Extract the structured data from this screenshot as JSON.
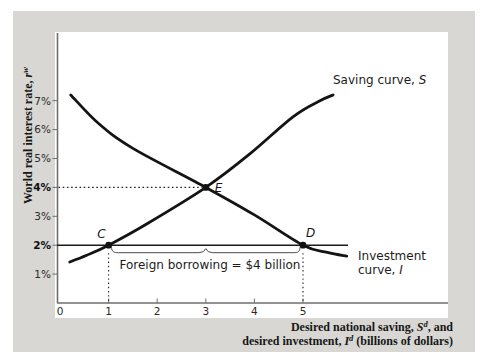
{
  "figure_labels": {
    "saving_curve": {
      "prefix": "Saving curve, ",
      "symbol": "S"
    },
    "investment_curve": {
      "line1": "Investment",
      "line2_prefix": "curve, ",
      "symbol": "I"
    },
    "annotation_foreign_borrowing": "Foreign borrowing = $4 billion",
    "y_axis_title": {
      "prefix": "World real interest rate, ",
      "symbol": "r",
      "superscript": "w"
    },
    "x_axis_title_line1": {
      "prefix": "Desired national saving, ",
      "symbol": "S",
      "superscript": "d",
      "suffix": ", and"
    },
    "x_axis_title_line2": {
      "prefix": "desired investment, ",
      "symbol": "I",
      "superscript": "d",
      "suffix": " (billions of dollars)"
    }
  },
  "chart_data": {
    "type": "line",
    "title": "",
    "xlabel": "Desired national saving, Sd, and desired investment, Id (billions of dollars)",
    "ylabel": "World real interest rate, rw (percent)",
    "xlim": [
      0,
      6.2
    ],
    "ylim_percent": [
      0,
      8
    ],
    "grid": false,
    "legend_position": "labels-on-curves",
    "x_ticks": [
      {
        "value": 0,
        "label": "0"
      },
      {
        "value": 1,
        "label": "1"
      },
      {
        "value": 2,
        "label": "2"
      },
      {
        "value": 3,
        "label": "3"
      },
      {
        "value": 4,
        "label": "4"
      },
      {
        "value": 5,
        "label": "5"
      }
    ],
    "y_ticks": [
      {
        "value": 1,
        "label": "1%",
        "bold": false
      },
      {
        "value": 2,
        "label": "2%",
        "bold": true
      },
      {
        "value": 3,
        "label": "3%",
        "bold": false
      },
      {
        "value": 4,
        "label": "4%",
        "bold": true
      },
      {
        "value": 5,
        "label": "5%",
        "bold": false
      },
      {
        "value": 6,
        "label": "6%",
        "bold": false
      },
      {
        "value": 7,
        "label": "7%",
        "bold": false
      }
    ],
    "series": [
      {
        "name": "Saving curve, S",
        "points": [
          [
            0.2,
            1.42
          ],
          [
            0.55,
            1.65
          ],
          [
            1,
            2
          ],
          [
            1.8,
            2.75
          ],
          [
            3,
            4
          ],
          [
            3.9,
            5.15
          ],
          [
            4.8,
            6.45
          ],
          [
            5.35,
            7.0
          ],
          [
            5.62,
            7.2
          ]
        ]
      },
      {
        "name": "Investment curve, I",
        "points": [
          [
            0.22,
            7.2
          ],
          [
            0.8,
            6.2
          ],
          [
            1.5,
            5.35
          ],
          [
            3,
            4
          ],
          [
            4,
            3.05
          ],
          [
            5,
            2
          ],
          [
            5.5,
            1.75
          ],
          [
            5.9,
            1.62
          ]
        ]
      }
    ],
    "key_points": [
      {
        "label": "E",
        "x": 3,
        "y": 4
      },
      {
        "label": "C",
        "x": 1,
        "y": 2
      },
      {
        "label": "D",
        "x": 5,
        "y": 2
      }
    ],
    "world_interest_rate_percent": 2,
    "equilibrium_rate_percent": 4,
    "foreign_borrowing_billions": 4,
    "guides": {
      "horizontal_dotted_at_percent": 4,
      "horizontal_dotted_to_x": 3,
      "vertical_dotted_at_x": [
        1,
        5
      ],
      "horizontal_solid_at_percent": 2
    }
  },
  "colors": {
    "page_gray": "#d8d7d4",
    "panel_white": "#ffffff",
    "curve_black": "#141414",
    "axis_gray": "#6e6e6c",
    "text_dark": "#1c1c1c",
    "brace_gray": "#4a4a4a"
  }
}
